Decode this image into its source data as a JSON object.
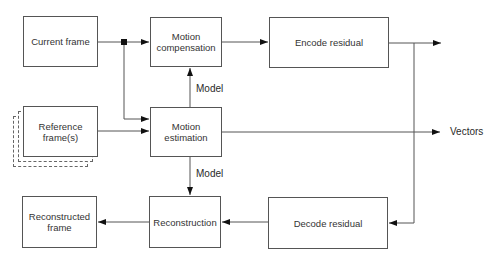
{
  "diagram": {
    "type": "block-diagram",
    "nodes": {
      "current_frame": "Current frame",
      "motion_compensation": "Motion compensation",
      "encode_residual": "Encode residual",
      "reference_frames": "Reference frame(s)",
      "motion_estimation": "Motion estimation",
      "reconstructed_frame": "Reconstructed frame",
      "reconstruction": "Reconstruction",
      "decode_residual": "Decode residual"
    },
    "labels": {
      "model_upper": "Model",
      "model_lower": "Model",
      "vectors": "Vectors"
    },
    "edges": [
      {
        "from": "current_frame",
        "to": "motion_compensation"
      },
      {
        "from": "current_frame",
        "to": "motion_estimation"
      },
      {
        "from": "reference_frames",
        "to": "motion_estimation"
      },
      {
        "from": "motion_estimation",
        "to": "motion_compensation",
        "label": "Model"
      },
      {
        "from": "motion_estimation",
        "to": "reconstruction",
        "label": "Model"
      },
      {
        "from": "motion_estimation",
        "to": "output",
        "label": "Vectors"
      },
      {
        "from": "motion_compensation",
        "to": "encode_residual"
      },
      {
        "from": "encode_residual",
        "to": "output"
      },
      {
        "from": "encode_residual",
        "to": "decode_residual"
      },
      {
        "from": "decode_residual",
        "to": "reconstruction"
      },
      {
        "from": "reconstruction",
        "to": "reconstructed_frame"
      }
    ],
    "colors": {
      "line": "#555555",
      "text": "#2a2a2a",
      "background": "#ffffff"
    }
  }
}
